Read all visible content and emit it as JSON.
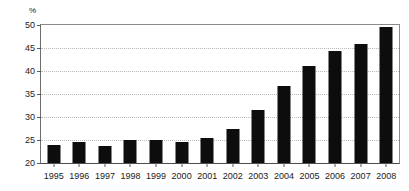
{
  "chart_data": {
    "type": "bar",
    "title": "",
    "subtitle": "",
    "xlabel": "",
    "ylabel": "",
    "unit_label": "%",
    "categories": [
      "1995",
      "1996",
      "1997",
      "1998",
      "1999",
      "2000",
      "2001",
      "2002",
      "2003",
      "2004",
      "2005",
      "2006",
      "2007",
      "2008"
    ],
    "values": [
      24.0,
      24.5,
      23.8,
      25.0,
      24.9,
      24.5,
      25.4,
      27.5,
      31.5,
      36.7,
      41.1,
      44.4,
      45.9,
      49.5
    ],
    "ylim": [
      20,
      50
    ],
    "yticks": [
      20,
      25,
      30,
      35,
      40,
      45,
      50
    ],
    "ytick_labels": [
      "20",
      "25",
      "30",
      "35",
      "40",
      "45",
      "50"
    ],
    "grid": true,
    "grid_style": "dotted-horizontal",
    "legend": false,
    "legend_position": "none",
    "bar_color": "#0d0d0d",
    "grid_color": "#b9b9b9",
    "axis_color": "#5a5a5a",
    "background_color": "#ffffff"
  }
}
